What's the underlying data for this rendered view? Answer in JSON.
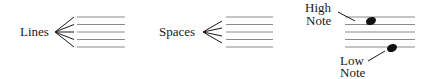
{
  "panels": [
    {
      "id": "lines",
      "label": "Lines"
    },
    {
      "id": "spaces",
      "label": "Spaces"
    },
    {
      "id": "notes",
      "high_label_1": "High",
      "high_label_2": "Note",
      "low_label_1": "Low",
      "low_label_2": "Note"
    }
  ],
  "colors": {
    "staff": "#8a8a8a",
    "ink": "#1a1a1a"
  }
}
